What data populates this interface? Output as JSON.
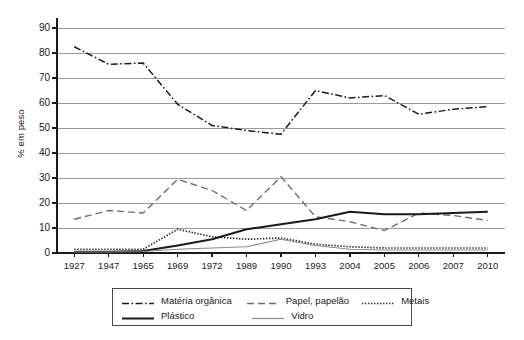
{
  "chart_data": {
    "type": "line",
    "title": "",
    "xlabel": "",
    "ylabel": "% em peso",
    "ylim": [
      0,
      90
    ],
    "yticks": [
      0,
      10,
      20,
      30,
      40,
      50,
      60,
      70,
      80,
      90
    ],
    "grid": true,
    "legend_position": "bottom",
    "categories": [
      "1927",
      "1947",
      "1965",
      "1969",
      "1972",
      "1989",
      "1990",
      "1993",
      "2004",
      "2005",
      "2006",
      "2007",
      "2010"
    ],
    "series": [
      {
        "name": "Matéria orgânica",
        "style": "dash-dot",
        "color": "#1a1a1a",
        "values": [
          82.5,
          75.5,
          76.0,
          59.5,
          51.0,
          49.0,
          47.5,
          65.0,
          62.0,
          63.0,
          55.5,
          57.5,
          58.5
        ]
      },
      {
        "name": "Papel, papelão",
        "style": "dashed",
        "color": "#6e6e6e",
        "values": [
          13.5,
          17.0,
          16.0,
          29.5,
          25.0,
          17.0,
          30.5,
          14.5,
          12.5,
          9.0,
          16.0,
          15.0,
          13.0
        ]
      },
      {
        "name": "Metais",
        "style": "dotted",
        "color": "#2b2b2b",
        "values": [
          1.5,
          1.5,
          1.5,
          9.5,
          6.5,
          5.5,
          6.0,
          3.5,
          2.5,
          2.0,
          2.0,
          2.0,
          2.0
        ]
      },
      {
        "name": "Plástico",
        "style": "solid-thick",
        "color": "#1a1a1a",
        "values": [
          0.5,
          0.5,
          0.8,
          3.0,
          5.5,
          9.5,
          11.5,
          13.5,
          16.5,
          15.5,
          15.5,
          16.0,
          16.5
        ]
      },
      {
        "name": "Vidro",
        "style": "solid-thin",
        "color": "#8a8a8a",
        "values": [
          0.4,
          0.4,
          0.6,
          1.5,
          2.0,
          2.5,
          5.5,
          3.0,
          1.5,
          1.2,
          1.2,
          1.2,
          1.2
        ]
      }
    ]
  },
  "axis": {
    "y_title": "% em peso",
    "y_labels": [
      "90",
      "80",
      "70",
      "60",
      "50",
      "40",
      "30",
      "20",
      "10",
      "0"
    ],
    "x_labels": [
      "1927",
      "1947",
      "1965",
      "1969",
      "1972",
      "1989",
      "1990",
      "1993",
      "2004",
      "2005",
      "2006",
      "2007",
      "2010"
    ]
  },
  "legend": {
    "row1": [
      {
        "label": "Matéria orgânica",
        "style": "dash-dot"
      },
      {
        "label": "Papel, papelão",
        "style": "dashed"
      },
      {
        "label": "Metais",
        "style": "dotted"
      }
    ],
    "row2": [
      {
        "label": "Plástico",
        "style": "solid-thick"
      },
      {
        "label": "Vidro",
        "style": "solid-thin"
      }
    ]
  }
}
